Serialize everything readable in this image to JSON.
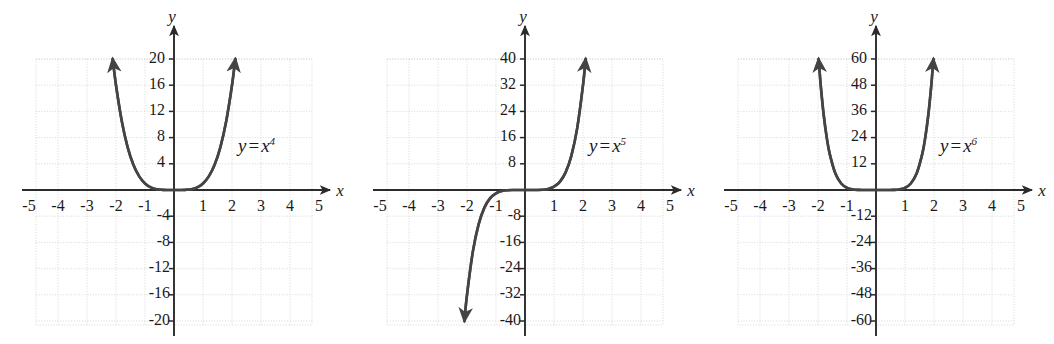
{
  "figure": {
    "type": "multi-panel-graph",
    "panel_count": 3,
    "background": "#ffffff",
    "axis_color": "#2b2b2b",
    "curve_color": "#444444",
    "grid_color": "#cfcfcf",
    "label_color": "#1a1a1a"
  },
  "panels": [
    {
      "id": "panel-x4",
      "equation_text": "y = x",
      "equation_exponent": "4",
      "equation_var_y": "y",
      "equation_sign": "=",
      "equation_var_x": "x",
      "x_axis_label": "x",
      "y_axis_label": "y",
      "x_ticks": [
        "-5",
        "-4",
        "-3",
        "-2",
        "-1",
        "1",
        "2",
        "3",
        "4",
        "5"
      ],
      "y_ticks_positive": [
        "4",
        "8",
        "12",
        "16",
        "20"
      ],
      "y_ticks_negative": [
        "-4",
        "-8",
        "-12",
        "-16",
        "-20"
      ]
    },
    {
      "id": "panel-x5",
      "equation_text": "y = x",
      "equation_exponent": "5",
      "equation_var_y": "y",
      "equation_sign": "=",
      "equation_var_x": "x",
      "x_axis_label": "x",
      "y_axis_label": "y",
      "x_ticks": [
        "-5",
        "-4",
        "-3",
        "-2",
        "-1",
        "1",
        "2",
        "3",
        "4",
        "5"
      ],
      "y_ticks_positive": [
        "8",
        "16",
        "24",
        "32",
        "40"
      ],
      "y_ticks_negative": [
        "-8",
        "-16",
        "-24",
        "-32",
        "-40"
      ]
    },
    {
      "id": "panel-x6",
      "equation_text": "y = x",
      "equation_exponent": "6",
      "equation_var_y": "y",
      "equation_sign": "=",
      "equation_var_x": "x",
      "x_axis_label": "x",
      "y_axis_label": "y",
      "x_ticks": [
        "-5",
        "-4",
        "-3",
        "-2",
        "-1",
        "1",
        "2",
        "3",
        "4",
        "5"
      ],
      "y_ticks_positive": [
        "12",
        "24",
        "36",
        "48",
        "60"
      ],
      "y_ticks_negative": [
        "-12",
        "-24",
        "-36",
        "-48",
        "-60"
      ]
    }
  ],
  "chart_data": [
    {
      "type": "line",
      "title": "y = x^4",
      "function": "y = x^4",
      "xlabel": "x",
      "ylabel": "y",
      "xlim": [
        -5,
        5
      ],
      "ylim": [
        -20,
        20
      ],
      "xticks": [
        -5,
        -4,
        -3,
        -2,
        -1,
        1,
        2,
        3,
        4,
        5
      ],
      "yticks": [
        -20,
        -16,
        -12,
        -8,
        -4,
        4,
        8,
        12,
        16,
        20
      ],
      "grid": true,
      "legend": "none",
      "annotations": [
        "y = x⁴"
      ],
      "series": [
        {
          "name": "y = x^4",
          "x": [
            -2.115,
            -2.0,
            -1.8,
            -1.6,
            -1.4,
            -1.2,
            -1.0,
            -0.8,
            -0.6,
            -0.4,
            -0.2,
            0.0,
            0.2,
            0.4,
            0.6,
            0.8,
            1.0,
            1.2,
            1.4,
            1.6,
            1.8,
            2.0,
            2.115
          ],
          "values": [
            20.0,
            16.0,
            10.4976,
            6.5536,
            3.8416,
            2.0736,
            1.0,
            0.4096,
            0.1296,
            0.0256,
            0.0016,
            0.0,
            0.0016,
            0.0256,
            0.1296,
            0.4096,
            1.0,
            2.0736,
            3.8416,
            6.5536,
            10.4976,
            16.0,
            20.0
          ],
          "arrowheads": [
            "start",
            "end"
          ]
        }
      ]
    },
    {
      "type": "line",
      "title": "y = x^5",
      "function": "y = x^5",
      "xlabel": "x",
      "ylabel": "y",
      "xlim": [
        -5,
        5
      ],
      "ylim": [
        -40,
        40
      ],
      "xticks": [
        -5,
        -4,
        -3,
        -2,
        -1,
        1,
        2,
        3,
        4,
        5
      ],
      "yticks": [
        -40,
        -32,
        -24,
        -16,
        -8,
        8,
        16,
        24,
        32,
        40
      ],
      "grid": true,
      "legend": "none",
      "annotations": [
        "y = x⁵"
      ],
      "series": [
        {
          "name": "y = x^5",
          "x": [
            -2.091,
            -2.0,
            -1.8,
            -1.6,
            -1.4,
            -1.2,
            -1.0,
            -0.8,
            -0.6,
            -0.4,
            -0.2,
            0.0,
            0.2,
            0.4,
            0.6,
            0.8,
            1.0,
            1.2,
            1.4,
            1.6,
            1.8,
            2.0,
            2.091
          ],
          "values": [
            -40.0,
            -32.0,
            -18.895,
            -10.486,
            -5.378,
            -2.488,
            -1.0,
            -0.328,
            -0.0778,
            -0.01024,
            -0.00032,
            0.0,
            0.00032,
            0.01024,
            0.0778,
            0.328,
            1.0,
            2.488,
            5.378,
            10.486,
            18.895,
            32.0,
            40.0
          ],
          "arrowheads": [
            "start",
            "end"
          ]
        }
      ]
    },
    {
      "type": "line",
      "title": "y = x^6",
      "function": "y = x^6",
      "xlabel": "x",
      "ylabel": "y",
      "xlim": [
        -5,
        5
      ],
      "ylim": [
        -60,
        60
      ],
      "xticks": [
        -5,
        -4,
        -3,
        -2,
        -1,
        1,
        2,
        3,
        4,
        5
      ],
      "yticks": [
        -60,
        -48,
        -36,
        -24,
        -12,
        12,
        24,
        36,
        48,
        60
      ],
      "grid": true,
      "legend": "none",
      "annotations": [
        "y = x⁶"
      ],
      "series": [
        {
          "name": "y = x^6",
          "x": [
            -1.979,
            -1.9,
            -1.8,
            -1.7,
            -1.6,
            -1.4,
            -1.2,
            -1.0,
            -0.8,
            -0.6,
            -0.4,
            -0.2,
            0.0,
            0.2,
            0.4,
            0.6,
            0.8,
            1.0,
            1.2,
            1.4,
            1.6,
            1.7,
            1.8,
            1.9,
            1.979
          ],
          "values": [
            60.0,
            47.05,
            34.01,
            24.14,
            16.78,
            7.53,
            2.986,
            1.0,
            0.262,
            0.0467,
            0.0041,
            6.4e-05,
            0.0,
            6.4e-05,
            0.0041,
            0.0467,
            0.262,
            1.0,
            2.986,
            7.53,
            16.78,
            24.14,
            34.01,
            47.05,
            60.0
          ],
          "arrowheads": [
            "start",
            "end"
          ]
        }
      ]
    }
  ]
}
